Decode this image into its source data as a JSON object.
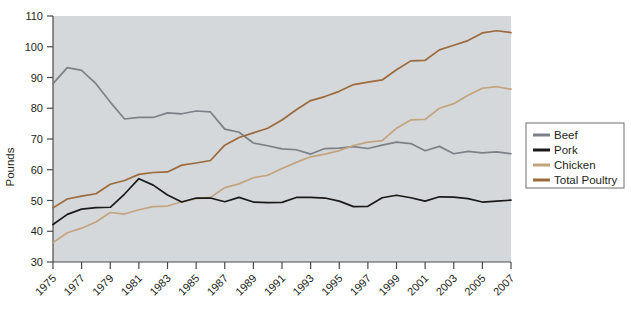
{
  "chart_data": {
    "type": "line",
    "title": "",
    "xlabel": "",
    "ylabel": "Pounds",
    "ylim": [
      30,
      110
    ],
    "yticks": [
      30,
      40,
      50,
      60,
      70,
      80,
      90,
      100,
      110
    ],
    "xlim": [
      1975,
      2007
    ],
    "xticks": [
      1975,
      1977,
      1979,
      1981,
      1983,
      1985,
      1987,
      1989,
      1991,
      1993,
      1995,
      1997,
      1999,
      2001,
      2003,
      2005,
      2007
    ],
    "xtick_labels": [
      "1975",
      "1977",
      "1979",
      "1981",
      "1983",
      "1985",
      "1987",
      "1989",
      "1991",
      "1993",
      "1995",
      "1997",
      "1999",
      "2001",
      "2003",
      "2005",
      "2007"
    ],
    "grid": false,
    "legend_position": "right",
    "plot_background": "#d5d8da",
    "x": [
      1975,
      1976,
      1977,
      1978,
      1979,
      1980,
      1981,
      1982,
      1983,
      1984,
      1985,
      1986,
      1987,
      1988,
      1989,
      1990,
      1991,
      1992,
      1993,
      1994,
      1995,
      1996,
      1997,
      1998,
      1999,
      2000,
      2001,
      2002,
      2003,
      2004,
      2005,
      2006,
      2007
    ],
    "series": [
      {
        "name": "Beef",
        "color": "#7c8188",
        "values": [
          88.0,
          93.2,
          92.3,
          88.0,
          82.0,
          76.5,
          77.0,
          77.0,
          78.5,
          78.2,
          79.1,
          78.8,
          73.2,
          72.2,
          68.7,
          67.8,
          66.8,
          66.5,
          65.1,
          66.9,
          67.0,
          67.5,
          66.9,
          68.0,
          69.0,
          68.5,
          66.2,
          67.6,
          65.2,
          66.0,
          65.5,
          65.8,
          65.2
        ]
      },
      {
        "name": "Pork",
        "color": "#1a1a1a",
        "values": [
          42.2,
          45.5,
          47.2,
          47.7,
          47.8,
          52.1,
          57.1,
          55.0,
          51.8,
          49.5,
          50.8,
          50.8,
          49.6,
          51.0,
          49.5,
          49.3,
          49.4,
          51.0,
          51.0,
          50.8,
          49.8,
          48.0,
          48.1,
          50.9,
          51.7,
          50.9,
          49.8,
          51.2,
          51.1,
          50.6,
          49.5,
          49.8,
          50.1
        ]
      },
      {
        "name": "Chicken",
        "color": "#c3a47e",
        "values": [
          36.3,
          39.5,
          41.0,
          43.0,
          46.1,
          45.6,
          47.0,
          48.0,
          48.2,
          49.6,
          50.6,
          51.0,
          54.2,
          55.4,
          57.4,
          58.2,
          60.4,
          62.4,
          64.2,
          65.1,
          66.2,
          67.9,
          69.0,
          69.5,
          73.5,
          76.2,
          76.4,
          80.0,
          81.5,
          84.2,
          86.5,
          87.0,
          86.2
        ]
      },
      {
        "name": "Total Poultry",
        "color": "#9c6a3c",
        "values": [
          47.6,
          50.5,
          51.4,
          52.2,
          55.3,
          56.5,
          58.5,
          59.1,
          59.3,
          61.5,
          62.2,
          63.0,
          68.0,
          70.5,
          72.0,
          73.5,
          76.2,
          79.5,
          82.5,
          83.8,
          85.5,
          87.7,
          88.5,
          89.2,
          92.5,
          95.4,
          95.6,
          99.0,
          100.5,
          102.0,
          104.5,
          105.2,
          104.6
        ]
      }
    ]
  },
  "legend": {
    "items": [
      {
        "label": "Beef",
        "color": "#7c8188"
      },
      {
        "label": "Pork",
        "color": "#1a1a1a"
      },
      {
        "label": "Chicken",
        "color": "#c3a47e"
      },
      {
        "label": "Total Poultry",
        "color": "#9c6a3c"
      }
    ]
  },
  "axes": {
    "y_title": "Pounds"
  }
}
